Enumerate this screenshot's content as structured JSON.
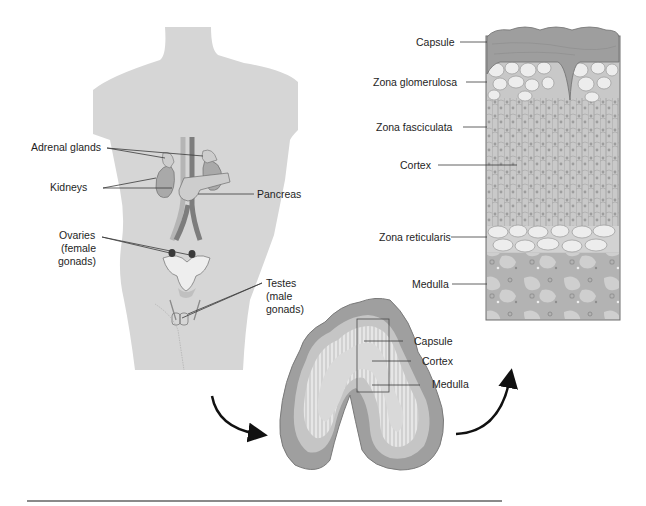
{
  "figure": {
    "type": "anatomical-diagram",
    "colors": {
      "body": "#d6d6d6",
      "organ": "#a9a9a9",
      "organ_light": "#c8c8c8",
      "vessel_dark": "#7a7a7a",
      "vessel_light": "#b8b8b8",
      "capsule": "#9c9c9c",
      "cell_light": "#efefef",
      "fasciculata": "#c4c4c4",
      "medulla": "#ababab",
      "rule": "#8a8a8a"
    }
  },
  "body_labels": {
    "adrenal_glands": "Adrenal glands",
    "kidneys": "Kidneys",
    "pancreas": "Pancreas",
    "ovaries": "Ovaries (female gonads)",
    "ovaries_line1": "Ovaries",
    "ovaries_line2": "(female",
    "ovaries_line3": "gonads)",
    "testes": "Testes (male gonads)",
    "testes_line1": "Testes",
    "testes_line2": "(male",
    "testes_line3": "gonads)"
  },
  "section_labels": {
    "capsule": "Capsule",
    "cortex": "Cortex",
    "medulla": "Medulla"
  },
  "histology_labels": {
    "capsule": "Capsule",
    "zona_glomerulosa": "Zona glomerulosa",
    "zona_fasciculata": "Zona fasciculata",
    "cortex": "Cortex",
    "zona_reticularis": "Zona reticularis",
    "medulla": "Medulla"
  }
}
